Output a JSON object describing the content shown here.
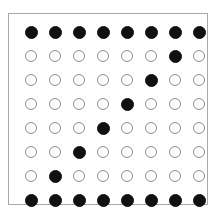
{
  "board": {
    "rows": 8,
    "cols": 8,
    "colors": {
      "filled": "#111111",
      "empty_border": "#8a8a8a",
      "frame": "#a8a8a8"
    },
    "grid": [
      [
        1,
        1,
        1,
        1,
        1,
        1,
        1,
        1
      ],
      [
        0,
        0,
        0,
        0,
        0,
        0,
        1,
        0
      ],
      [
        0,
        0,
        0,
        0,
        0,
        1,
        0,
        0
      ],
      [
        0,
        0,
        0,
        0,
        1,
        0,
        0,
        0
      ],
      [
        0,
        0,
        0,
        1,
        0,
        0,
        0,
        0
      ],
      [
        0,
        0,
        1,
        0,
        0,
        0,
        0,
        0
      ],
      [
        0,
        1,
        0,
        0,
        0,
        0,
        0,
        0
      ],
      [
        1,
        1,
        1,
        1,
        1,
        1,
        1,
        1
      ]
    ]
  }
}
